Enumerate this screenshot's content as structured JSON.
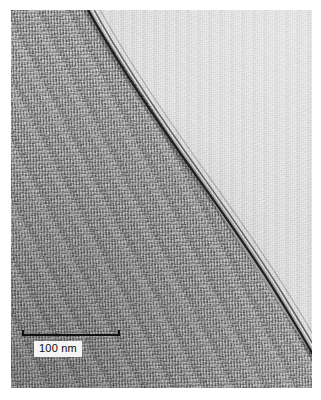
{
  "figure": {
    "kind": "tem-micrograph",
    "background_color": "#ffffff"
  },
  "micrograph": {
    "regions": [
      {
        "name": "dark-matrix",
        "position": "lower-left",
        "color": "#9a9a9a",
        "texture": "coarse vertical streaked grain"
      },
      {
        "name": "light-matrix",
        "position": "upper-right",
        "color": "#dcdcdc",
        "texture": "fine speckle"
      }
    ],
    "interface": {
      "name": "diagonal-boundary-line",
      "color": "#1a1a1a",
      "description": "dark fringe separating the two regions",
      "start": [
        77,
        0
      ],
      "end": [
        301,
        345
      ]
    }
  },
  "scalebar": {
    "label": "100 nm",
    "length_nm": 100,
    "line_color": "#101010",
    "label_background": "#f4f4f2",
    "label_color": "#0d0d0d"
  }
}
